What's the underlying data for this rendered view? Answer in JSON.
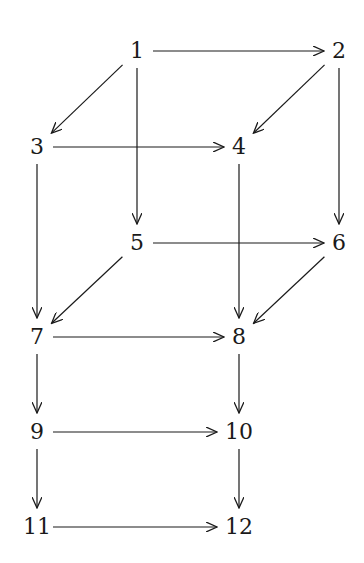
{
  "diagram": {
    "type": "directed-graph",
    "colors": {
      "stroke": "#1a1a1a",
      "background": "#ffffff"
    },
    "nodes": [
      {
        "id": "1",
        "label": "1",
        "x": 137,
        "y": 51
      },
      {
        "id": "2",
        "label": "2",
        "x": 339,
        "y": 51
      },
      {
        "id": "3",
        "label": "3",
        "x": 37,
        "y": 147
      },
      {
        "id": "4",
        "label": "4",
        "x": 239,
        "y": 147
      },
      {
        "id": "5",
        "label": "5",
        "x": 137,
        "y": 243
      },
      {
        "id": "6",
        "label": "6",
        "x": 339,
        "y": 243
      },
      {
        "id": "7",
        "label": "7",
        "x": 37,
        "y": 337
      },
      {
        "id": "8",
        "label": "8",
        "x": 239,
        "y": 337
      },
      {
        "id": "9",
        "label": "9",
        "x": 37,
        "y": 432
      },
      {
        "id": "10",
        "label": "10",
        "x": 239,
        "y": 432
      },
      {
        "id": "11",
        "label": "11",
        "x": 37,
        "y": 527
      },
      {
        "id": "12",
        "label": "12",
        "x": 239,
        "y": 527
      }
    ],
    "edges": [
      {
        "from": "1",
        "to": "2"
      },
      {
        "from": "1",
        "to": "3"
      },
      {
        "from": "1",
        "to": "5"
      },
      {
        "from": "2",
        "to": "4"
      },
      {
        "from": "2",
        "to": "6"
      },
      {
        "from": "3",
        "to": "4"
      },
      {
        "from": "3",
        "to": "7"
      },
      {
        "from": "4",
        "to": "8"
      },
      {
        "from": "5",
        "to": "6"
      },
      {
        "from": "5",
        "to": "7"
      },
      {
        "from": "6",
        "to": "8"
      },
      {
        "from": "7",
        "to": "8"
      },
      {
        "from": "7",
        "to": "9"
      },
      {
        "from": "8",
        "to": "10"
      },
      {
        "from": "9",
        "to": "10"
      },
      {
        "from": "9",
        "to": "11"
      },
      {
        "from": "10",
        "to": "12"
      },
      {
        "from": "11",
        "to": "12"
      }
    ]
  }
}
